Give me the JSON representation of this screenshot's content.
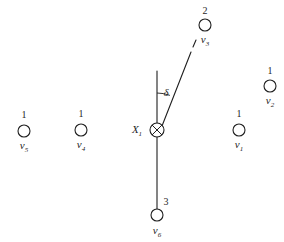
{
  "figure": {
    "kind": "vector-force-diagram",
    "background_color": "#ffffff",
    "stroke_color": "#1f1f1f",
    "width": 284,
    "height": 242,
    "angle_label": "δ",
    "center_label": "X",
    "center_label_sub": "1",
    "center_symbol": "crossed-circle"
  },
  "nodes": [
    {
      "id": "v5",
      "count": "1",
      "name": "v",
      "sub": "5",
      "cx": 24,
      "cy": 131,
      "r": 6,
      "count_x": 24,
      "count_y": 115,
      "name_x": 24,
      "name_y": 147
    },
    {
      "id": "v4",
      "count": "1",
      "name": "v",
      "sub": "4",
      "cx": 81,
      "cy": 130,
      "r": 6,
      "count_x": 81,
      "count_y": 114,
      "name_x": 81,
      "name_y": 146
    },
    {
      "id": "v1",
      "count": "1",
      "name": "v",
      "sub": "1",
      "cx": 239,
      "cy": 130,
      "r": 6,
      "count_x": 239,
      "count_y": 114,
      "name_x": 239,
      "name_y": 146
    },
    {
      "id": "v2",
      "count": "1",
      "name": "v",
      "sub": "2",
      "cx": 270,
      "cy": 86,
      "r": 6,
      "count_x": 270,
      "count_y": 71,
      "name_x": 270,
      "name_y": 102
    },
    {
      "id": "v3",
      "count": "2",
      "name": "v",
      "sub": "3",
      "cx": 205,
      "cy": 25,
      "r": 6,
      "count_x": 205,
      "count_y": 11,
      "name_x": 205,
      "name_y": 41
    },
    {
      "id": "v6",
      "count": "3",
      "name": "v",
      "sub": "6",
      "cx": 157,
      "cy": 215,
      "r": 6,
      "count_x": 166,
      "count_y": 202,
      "name_x": 157,
      "name_y": 232
    }
  ],
  "lines": {
    "vertical_reference": {
      "x1": 157,
      "y1": 71,
      "x2": 157,
      "y2": 129
    },
    "lower_stem": {
      "x1": 157,
      "y1": 136,
      "x2": 157,
      "y2": 209
    },
    "slant_solid": {
      "x1": 162,
      "y1": 126,
      "x2": 191,
      "y2": 52
    },
    "slant_dash": {
      "x1": 193,
      "y1": 47,
      "x2": 196,
      "y2": 40
    },
    "angle_arc": {
      "cx": 157,
      "cy": 129,
      "r": 36,
      "start_deg": 0,
      "end_deg": 21
    },
    "delta_label_x": 166,
    "delta_label_y": 92
  }
}
